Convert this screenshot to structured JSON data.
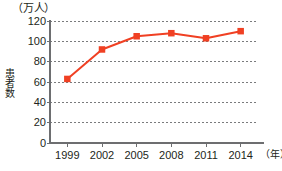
{
  "chart_data": {
    "type": "line",
    "title": "",
    "subtitle": "",
    "unit_label": "（万人）",
    "ylabel": "患者数",
    "xlabel": "（年）",
    "categories": [
      "1999",
      "2002",
      "2005",
      "2008",
      "2011",
      "2014"
    ],
    "values": [
      63,
      92,
      105,
      108,
      103,
      110
    ],
    "series": [
      {
        "name": "患者数",
        "values": [
          63,
          92,
          105,
          108,
          103,
          110
        ],
        "color": "#f04023",
        "marker": "square"
      }
    ],
    "ylim": [
      0,
      120
    ],
    "ytick_values": [
      0,
      20,
      40,
      60,
      80,
      100,
      120
    ],
    "ytick_labels": [
      "0",
      "20",
      "40",
      "60",
      "80",
      "100",
      "120"
    ],
    "xtick_labels": [
      "1999",
      "2002",
      "2005",
      "2008",
      "2011",
      "2014"
    ],
    "grid": "horizontal-dotted",
    "legend": "none",
    "axis_color": "#6d6e70",
    "grid_color": "#7a7b7d",
    "text_color": "#231f20"
  },
  "layout": {
    "plot_left": 50,
    "plot_right": 258,
    "plot_top": 21,
    "plot_bottom": 143
  }
}
